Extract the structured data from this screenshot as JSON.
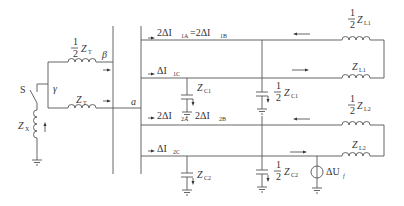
{
  "figure": {
    "type": "equivalent circuit (two-line system, transformer + network)",
    "labels": {
      "switch": "S",
      "node_beta": "β",
      "node_gamma": "γ",
      "node_a": "a",
      "zt_half_num": "1",
      "zt_half_den": "2",
      "zt_half": "Z",
      "zt_half_sub": "T",
      "zt": "Z",
      "zt_sub": "T",
      "zx": "Z",
      "zx_sub": "X",
      "i1a": "2ΔI",
      "i1a_sub": "1A",
      "i1a_eq": "=2ΔI",
      "i1b_sub": "1B",
      "i1c": "ΔI",
      "i1c_sub": "1C",
      "i2a": "2ΔI",
      "i2a_sub": "2A",
      "i2b": "2ΔI",
      "i2b_sub": "2B",
      "i2c": "ΔI",
      "i2c_sub": "2C",
      "zc1": "Z",
      "zc1_sub": "C1",
      "zc1_half_num": "1",
      "zc1_half_den": "2",
      "zc1_half": "Z",
      "zc1_half_sub": "C1",
      "zc2": "Z",
      "zc2_sub": "C2",
      "zc2_half_num": "1",
      "zc2_half_den": "2",
      "zc2_half": "Z",
      "zc2_half_sub": "C2",
      "zl1_half_num": "1",
      "zl1_half_den": "2",
      "zl1_half": "Z",
      "zl1_half_sub": "L1",
      "zl1": "Z",
      "zl1_sub": "L1",
      "zl2_half_num": "1",
      "zl2_half_den": "2",
      "zl2_half": "Z",
      "zl2_half_sub": "L2",
      "zl2": "Z",
      "zl2_sub": "L2",
      "source": "ΔU",
      "source_sub": "f"
    }
  }
}
